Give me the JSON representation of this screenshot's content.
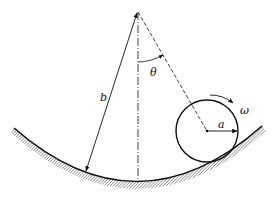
{
  "figure": {
    "labels": {
      "b": "b",
      "theta": "θ",
      "omega": "ω",
      "a": "a"
    },
    "colors": {
      "stroke": "#111111",
      "hatch": "#555555",
      "background": "#ffffff"
    }
  }
}
